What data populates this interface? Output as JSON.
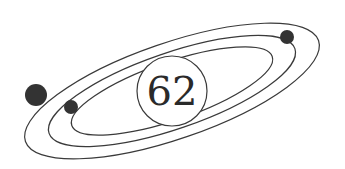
{
  "diagram": {
    "type": "orbit-emblem",
    "center_label": "62",
    "colors": {
      "background": "#ffffff",
      "stroke": "#3a3a3a",
      "planet": "#333333"
    },
    "orbits": [
      {
        "name": "outer",
        "rx": 155,
        "ry": 48
      },
      {
        "name": "middle",
        "rx": 130,
        "ry": 38
      },
      {
        "name": "inner",
        "rx": 106,
        "ry": 29
      }
    ],
    "planets": [
      {
        "name": "large",
        "cx": 36,
        "cy": 95,
        "r": 11
      },
      {
        "name": "medium",
        "cx": 71,
        "cy": 107,
        "r": 7
      },
      {
        "name": "small",
        "cx": 287,
        "cy": 37,
        "r": 7
      }
    ]
  }
}
